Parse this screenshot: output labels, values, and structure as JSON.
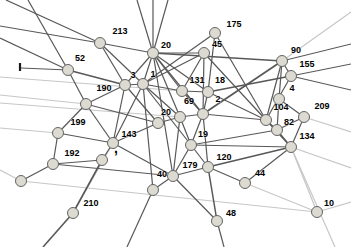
{
  "figure": {
    "background": "#ffffff",
    "node_fill": "#dcdad1",
    "node_stroke": "#646464",
    "node_radius": 5.5,
    "edge_dark": "#585858",
    "edge_light": "#c7c7c7",
    "label_color": "#000000",
    "label_font_size": 9
  },
  "graph": {
    "nodes": [
      {
        "id": "213",
        "label": "213",
        "x": 100,
        "y": 43,
        "lx": 120,
        "ly": 34
      },
      {
        "id": "20a",
        "label": "20",
        "x": 153,
        "y": 53,
        "lx": 166,
        "ly": 48
      },
      {
        "id": "175",
        "label": "175",
        "x": 215,
        "y": 33,
        "lx": 234,
        "ly": 27
      },
      {
        "id": "45",
        "label": "45",
        "x": 204,
        "y": 53,
        "lx": 217,
        "ly": 47
      },
      {
        "id": "90",
        "label": "90",
        "x": 282,
        "y": 61,
        "lx": 296,
        "ly": 53
      },
      {
        "id": "155",
        "label": "155",
        "x": 291,
        "y": 76,
        "lx": 307,
        "ly": 67
      },
      {
        "id": "52",
        "label": "52",
        "x": 68,
        "y": 70,
        "lx": 80,
        "ly": 61
      },
      {
        "id": "3",
        "label": "3",
        "x": 125,
        "y": 85,
        "lx": 133,
        "ly": 78
      },
      {
        "id": "1",
        "label": "1",
        "x": 143,
        "y": 84,
        "lx": 153,
        "ly": 77
      },
      {
        "id": "131",
        "label": "131",
        "x": 182,
        "y": 91,
        "lx": 197,
        "ly": 83
      },
      {
        "id": "18",
        "label": "18",
        "x": 208,
        "y": 92,
        "lx": 220,
        "ly": 83
      },
      {
        "id": "4",
        "label": "4",
        "x": 279,
        "y": 99,
        "lx": 292,
        "ly": 91
      },
      {
        "id": "209",
        "label": "209",
        "x": 304,
        "y": 117,
        "lx": 322,
        "ly": 109
      },
      {
        "id": "104",
        "label": "104",
        "x": 266,
        "y": 120,
        "lx": 281,
        "ly": 110
      },
      {
        "id": "82",
        "label": "82",
        "x": 277,
        "y": 130,
        "lx": 289,
        "ly": 125
      },
      {
        "id": "134",
        "label": "134",
        "x": 291,
        "y": 147,
        "lx": 307,
        "ly": 139
      },
      {
        "id": "190",
        "label": "190",
        "x": 86,
        "y": 104,
        "lx": 104,
        "ly": 91
      },
      {
        "id": "199",
        "label": "199",
        "x": 58,
        "y": 133,
        "lx": 78,
        "ly": 125
      },
      {
        "id": "143",
        "label": "143",
        "x": 113,
        "y": 143,
        "lx": 129,
        "ly": 137
      },
      {
        "id": "20b",
        "label": "20",
        "x": 158,
        "y": 123,
        "lx": 166,
        "ly": 115
      },
      {
        "id": "69",
        "label": "69",
        "x": 180,
        "y": 117,
        "lx": 189,
        "ly": 104
      },
      {
        "id": "2",
        "label": "2",
        "x": 203,
        "y": 114,
        "lx": 218,
        "ly": 102
      },
      {
        "id": "19",
        "label": "19",
        "x": 191,
        "y": 145,
        "lx": 203,
        "ly": 137
      },
      {
        "id": "192",
        "label": "192",
        "x": 53,
        "y": 164,
        "lx": 72,
        "ly": 156
      },
      {
        "id": "120",
        "label": "120",
        "x": 208,
        "y": 167,
        "lx": 224,
        "ly": 160
      },
      {
        "id": "179",
        "label": "179",
        "x": 173,
        "y": 176,
        "lx": 190,
        "ly": 168
      },
      {
        "id": "40",
        "label": "40",
        "x": 153,
        "y": 190,
        "lx": 162,
        "ly": 177
      },
      {
        "id": "210",
        "label": "210",
        "x": 73,
        "y": 213,
        "lx": 91,
        "ly": 206
      },
      {
        "id": "48",
        "label": "48",
        "x": 217,
        "y": 221,
        "lx": 231,
        "ly": 216
      },
      {
        "id": "44",
        "label": "44",
        "x": 245,
        "y": 183,
        "lx": 260,
        "ly": 176
      },
      {
        "id": "10",
        "label": "10",
        "x": 317,
        "y": 212,
        "lx": 329,
        "ly": 206
      },
      {
        "id": "u1",
        "label": "",
        "x": 21,
        "y": 181,
        "lx": 0,
        "ly": 0
      },
      {
        "id": "u2",
        "label": "",
        "x": 102,
        "y": 160,
        "lx": 0,
        "ly": 0
      }
    ],
    "edges": [
      {
        "a": "u1",
        "px": 0,
        "py": 170,
        "t": "l"
      },
      {
        "a": "u1",
        "b": "10",
        "t": "l"
      },
      {
        "a": "10",
        "b": "134",
        "t": "l"
      },
      {
        "a": "10",
        "b": "44",
        "t": "l"
      },
      {
        "a": "10",
        "px": 351,
        "py": 202,
        "t": "l"
      },
      {
        "a": "134",
        "px": 351,
        "py": 168,
        "t": "l"
      },
      {
        "a": "134",
        "px": 335,
        "py": 247,
        "t": "l"
      },
      {
        "a": "209",
        "px": 351,
        "py": 132,
        "t": "l"
      },
      {
        "a": "90",
        "px": 351,
        "py": 12,
        "t": "l"
      },
      {
        "a": "199",
        "px": 0,
        "py": 128,
        "t": "l"
      },
      {
        "a": "131",
        "px": 0,
        "py": 77,
        "t": "l"
      },
      {
        "a": "69",
        "px": 0,
        "py": 103,
        "t": "l"
      },
      {
        "a": "210",
        "b": "143",
        "t": "l"
      },
      {
        "a": "190",
        "px": 0,
        "py": 95,
        "t": "l"
      },
      {
        "a": "20a",
        "px": 137,
        "py": 0
      },
      {
        "a": "20a",
        "px": 153,
        "py": 0
      },
      {
        "a": "20a",
        "px": 168,
        "py": 0
      },
      {
        "a": "20a",
        "b": "213"
      },
      {
        "a": "20a",
        "b": "3"
      },
      {
        "a": "20a",
        "b": "1"
      },
      {
        "a": "20a",
        "b": "131"
      },
      {
        "a": "20a",
        "b": "18"
      },
      {
        "a": "20a",
        "b": "2"
      },
      {
        "a": "20a",
        "b": "69"
      },
      {
        "a": "20a",
        "b": "45"
      },
      {
        "a": "20a",
        "b": "90",
        "w": 1.7
      },
      {
        "a": "20a",
        "b": "179"
      },
      {
        "a": "213",
        "b": "3"
      },
      {
        "a": "213",
        "b": "1"
      },
      {
        "a": "213",
        "px": 6,
        "py": 0
      },
      {
        "a": "213",
        "px": 0,
        "py": 26
      },
      {
        "a": "52",
        "b": "3",
        "w": 1.6
      },
      {
        "a": "52",
        "b": "190"
      },
      {
        "a": "52",
        "px": 0,
        "py": 38
      },
      {
        "a": "52",
        "px": 28,
        "py": 0
      },
      {
        "a": "52",
        "px": 21,
        "py": 68
      },
      {
        "a": "175",
        "b": "1"
      },
      {
        "a": "175",
        "b": "18"
      },
      {
        "a": "175",
        "b": "104"
      },
      {
        "a": "45",
        "b": "1"
      },
      {
        "a": "45",
        "b": "2"
      },
      {
        "a": "45",
        "b": "131"
      },
      {
        "a": "45",
        "b": "104"
      },
      {
        "a": "90",
        "b": "2",
        "w": 1.7
      },
      {
        "a": "90",
        "b": "4"
      },
      {
        "a": "90",
        "b": "104"
      },
      {
        "a": "90",
        "b": "155"
      },
      {
        "a": "90",
        "px": 351,
        "py": 44
      },
      {
        "a": "155",
        "b": "18",
        "w": 1.6
      },
      {
        "a": "155",
        "b": "104"
      },
      {
        "a": "155",
        "px": 351,
        "py": 64
      },
      {
        "a": "155",
        "px": 351,
        "py": 90
      },
      {
        "a": "4",
        "b": "82"
      },
      {
        "a": "209",
        "b": "82"
      },
      {
        "a": "209",
        "b": "4"
      },
      {
        "a": "104",
        "b": "82"
      },
      {
        "a": "104",
        "b": "2"
      },
      {
        "a": "104",
        "b": "18"
      },
      {
        "a": "104",
        "b": "134"
      },
      {
        "a": "82",
        "b": "134"
      },
      {
        "a": "82",
        "b": "19"
      },
      {
        "a": "134",
        "b": "120",
        "w": 1.6
      },
      {
        "a": "134",
        "b": "44"
      },
      {
        "a": "134",
        "b": "19"
      },
      {
        "a": "134",
        "b": "209"
      },
      {
        "a": "3",
        "b": "1"
      },
      {
        "a": "3",
        "b": "190"
      },
      {
        "a": "3",
        "b": "20b"
      },
      {
        "a": "3",
        "b": "143"
      },
      {
        "a": "1",
        "b": "131"
      },
      {
        "a": "1",
        "b": "69"
      },
      {
        "a": "1",
        "b": "19"
      },
      {
        "a": "1",
        "b": "143"
      },
      {
        "a": "1",
        "b": "40"
      },
      {
        "a": "131",
        "b": "18"
      },
      {
        "a": "131",
        "b": "2"
      },
      {
        "a": "18",
        "b": "2"
      },
      {
        "a": "2",
        "b": "69"
      },
      {
        "a": "2",
        "b": "19"
      },
      {
        "a": "2",
        "b": "120"
      },
      {
        "a": "69",
        "b": "20b"
      },
      {
        "a": "69",
        "b": "19"
      },
      {
        "a": "69",
        "b": "179"
      },
      {
        "a": "20b",
        "b": "143"
      },
      {
        "a": "20b",
        "b": "190"
      },
      {
        "a": "19",
        "b": "120"
      },
      {
        "a": "19",
        "b": "179"
      },
      {
        "a": "190",
        "b": "143"
      },
      {
        "a": "190",
        "b": "199"
      },
      {
        "a": "199",
        "b": "143"
      },
      {
        "a": "199",
        "b": "192"
      },
      {
        "a": "143",
        "b": "179"
      },
      {
        "a": "143",
        "b": "u2"
      },
      {
        "a": "192",
        "b": "u1"
      },
      {
        "a": "192",
        "b": "u2"
      },
      {
        "a": "192",
        "b": "179"
      },
      {
        "a": "u2",
        "b": "210",
        "w": 1.6
      },
      {
        "a": "210",
        "px": 43,
        "py": 247,
        "w": 1.6
      },
      {
        "a": "179",
        "b": "120"
      },
      {
        "a": "179",
        "b": "40"
      },
      {
        "a": "179",
        "b": "48"
      },
      {
        "a": "120",
        "b": "44"
      },
      {
        "a": "120",
        "b": "48",
        "w": 1.5
      },
      {
        "a": "40",
        "px": 127,
        "py": 247
      },
      {
        "a": "48",
        "px": 224,
        "py": 247
      }
    ],
    "marks": [
      {
        "type": "tick",
        "x1": 20,
        "y1": 63,
        "x2": 20,
        "y2": 71
      },
      {
        "type": "comma",
        "x": 114,
        "y": 153,
        "glyph": ","
      }
    ]
  }
}
